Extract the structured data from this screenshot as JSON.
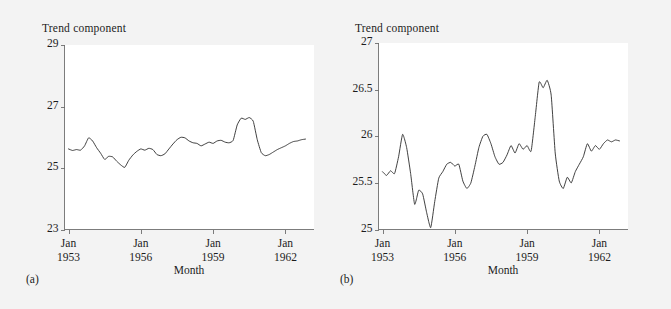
{
  "figure": {
    "background_color": "#f3f3f3",
    "plot_background_color": "#ffffff",
    "line_color": "#2b2b2b",
    "axis_color": "#6e6e6e"
  },
  "panel_a": {
    "caption": "(a)",
    "title": "Trend component",
    "xlabel": "Month",
    "ytick_labels": [
      "29",
      "27",
      "25",
      "23"
    ],
    "xtick_lines": [
      [
        "Jan",
        "1953"
      ],
      [
        "Jan",
        "1956"
      ],
      [
        "Jan",
        "1959"
      ],
      [
        "Jan",
        "1962"
      ]
    ]
  },
  "panel_b": {
    "caption": "(b)",
    "title": "Trend component",
    "xlabel": "Month",
    "ytick_labels": [
      "27",
      "26.5",
      "26",
      "25.5",
      "25"
    ],
    "xtick_lines": [
      [
        "Jan",
        "1953"
      ],
      [
        "Jan",
        "1956"
      ],
      [
        "Jan",
        "1959"
      ],
      [
        "Jan",
        "1962"
      ]
    ]
  },
  "chart_data": [
    {
      "type": "line",
      "panel": "(a)",
      "title": "Trend component",
      "xlabel": "Month",
      "ylabel": "Trend component",
      "ylim": [
        23,
        29
      ],
      "yticks": [
        23,
        25,
        27,
        29
      ],
      "grid": false,
      "legend": "none",
      "x_start": "1953-01",
      "x_tick_labels": [
        "Jan 1953",
        "Jan 1956",
        "Jan 1959",
        "Jan 1962"
      ],
      "x_tick_months": [
        0,
        36,
        72,
        108
      ],
      "xlim_months": [
        -2,
        122
      ],
      "series": [
        {
          "name": "trend",
          "x_months": [
            0,
            2,
            4,
            6,
            8,
            10,
            12,
            14,
            16,
            18,
            20,
            22,
            24,
            26,
            28,
            30,
            32,
            34,
            36,
            38,
            40,
            42,
            44,
            46,
            48,
            50,
            52,
            54,
            56,
            58,
            60,
            62,
            64,
            66,
            68,
            70,
            72,
            74,
            76,
            78,
            80,
            82,
            84,
            86,
            88,
            90,
            92,
            94,
            96,
            98,
            100,
            102,
            104,
            106,
            108,
            110,
            112,
            114,
            116,
            118
          ],
          "values": [
            25.62,
            25.57,
            25.6,
            25.58,
            25.72,
            25.98,
            25.88,
            25.66,
            25.48,
            25.28,
            25.38,
            25.36,
            25.22,
            25.1,
            25.02,
            25.25,
            25.42,
            25.54,
            25.62,
            25.58,
            25.64,
            25.6,
            25.44,
            25.4,
            25.46,
            25.62,
            25.78,
            25.92,
            26.0,
            25.98,
            25.88,
            25.82,
            25.8,
            25.72,
            25.78,
            25.84,
            25.8,
            25.88,
            25.9,
            25.84,
            25.82,
            25.9,
            26.4,
            26.62,
            26.58,
            26.64,
            26.52,
            25.92,
            25.5,
            25.4,
            25.44,
            25.52,
            25.6,
            25.66,
            25.72,
            25.8,
            25.86,
            25.88,
            25.92,
            25.94
          ]
        }
      ]
    },
    {
      "type": "line",
      "panel": "(b)",
      "title": "Trend component",
      "xlabel": "Month",
      "ylabel": "Trend component",
      "ylim": [
        25,
        27
      ],
      "yticks": [
        25,
        25.5,
        26,
        26.5,
        27
      ],
      "grid": false,
      "legend": "none",
      "x_start": "1953-01",
      "x_tick_labels": [
        "Jan 1953",
        "Jan 1956",
        "Jan 1959",
        "Jan 1962"
      ],
      "x_tick_months": [
        0,
        36,
        72,
        108
      ],
      "xlim_months": [
        -2,
        122
      ],
      "series": [
        {
          "name": "trend",
          "x_months": [
            0,
            2,
            4,
            6,
            8,
            10,
            12,
            14,
            16,
            18,
            20,
            22,
            24,
            26,
            28,
            30,
            32,
            34,
            36,
            38,
            40,
            42,
            44,
            46,
            48,
            50,
            52,
            54,
            56,
            58,
            60,
            62,
            64,
            66,
            68,
            70,
            72,
            74,
            76,
            78,
            80,
            82,
            84,
            86,
            88,
            90,
            92,
            94,
            96,
            98,
            100,
            102,
            104,
            106,
            108,
            110,
            112,
            114,
            116,
            118
          ],
          "values": [
            25.62,
            25.58,
            25.63,
            25.6,
            25.78,
            26.02,
            25.88,
            25.6,
            25.27,
            25.42,
            25.38,
            25.18,
            25.02,
            25.3,
            25.55,
            25.62,
            25.7,
            25.72,
            25.68,
            25.7,
            25.52,
            25.44,
            25.5,
            25.68,
            25.88,
            26.0,
            26.02,
            25.92,
            25.78,
            25.7,
            25.72,
            25.8,
            25.9,
            25.82,
            25.92,
            25.86,
            25.9,
            25.84,
            26.2,
            26.58,
            26.52,
            26.6,
            26.44,
            25.82,
            25.52,
            25.44,
            25.56,
            25.5,
            25.62,
            25.7,
            25.78,
            25.92,
            25.84,
            25.9,
            25.86,
            25.92,
            25.96,
            25.94,
            25.96,
            25.95
          ]
        }
      ]
    }
  ]
}
